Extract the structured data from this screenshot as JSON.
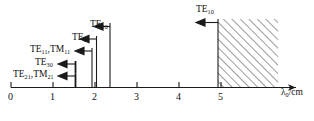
{
  "figure": {
    "type": "mode-cutoff-wavelength-chart",
    "axis": {
      "label_main": "λ",
      "label_sub": "0",
      "label_unit": "/cm",
      "tick_labels": [
        "0",
        "1",
        "2",
        "3",
        "4",
        "5"
      ],
      "tick_values": [
        0,
        1,
        2,
        3,
        4,
        5
      ],
      "range": [
        0,
        6.9
      ]
    },
    "modes": [
      {
        "name": "TE",
        "sub": "21",
        "name2": "TM",
        "sub2": "21",
        "value": 1.5,
        "label": "TE21,TM21"
      },
      {
        "name": "TE",
        "sub": "30",
        "value": 1.5,
        "label": "TE30"
      },
      {
        "name": "TE",
        "sub": "11",
        "name2": "TM",
        "sub2": "11",
        "value": 1.9,
        "label": "TE11,TM11"
      },
      {
        "name": "TE",
        "sub": "01",
        "value": 2.0,
        "label": "TE01"
      },
      {
        "name": "TE",
        "sub": "20",
        "value": 2.3,
        "label": "TE20"
      },
      {
        "name": "TE",
        "sub": "10",
        "value": 4.5,
        "label": "TE10"
      }
    ],
    "hatched_region": {
      "start": 4.5,
      "end": 6.35,
      "note": "single-mode operating band"
    },
    "colors": {
      "line": "#1a1a1a",
      "hatch": "#4a4a4a",
      "text": "#111111"
    }
  }
}
